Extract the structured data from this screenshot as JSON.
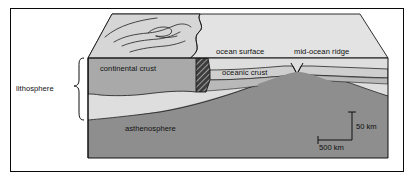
{
  "figure": {
    "frame_border_color": "#0a0a0a",
    "background_color": "#ffffff"
  },
  "labels": {
    "lithosphere": "lithosphere",
    "continental_crust": "continental crust",
    "ocean_surface": "ocean surface",
    "mid_ocean_ridge": "mid-ocean ridge",
    "oceanic_crust": "oceanic crust",
    "asthenosphere": "asthenosphere"
  },
  "scale_bar": {
    "vertical_label": "50 km",
    "horizontal_label": "500 km"
  },
  "layers": [
    {
      "name": "top-land-surface",
      "color": "#d8d8d8"
    },
    {
      "name": "top-ocean-surface",
      "color": "#e2e2e2"
    },
    {
      "name": "continental-crust",
      "color": "#a8a8a8"
    },
    {
      "name": "subduction-wedge",
      "color": "#3a3a3a"
    },
    {
      "name": "oceanic-crust",
      "color": "#c9c9c9"
    },
    {
      "name": "lower-lithosphere",
      "color": "#dedede"
    },
    {
      "name": "asthenosphere",
      "color": "#8e8e8e"
    },
    {
      "name": "side-face",
      "color": "#bdbdbd"
    }
  ]
}
